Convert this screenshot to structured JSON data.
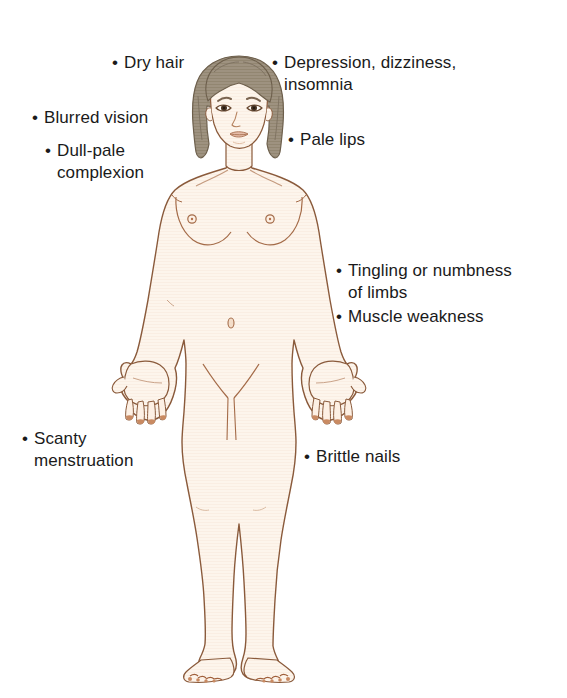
{
  "diagram": {
    "background_color": "#ffffff",
    "text_color": "#1a1a1a",
    "bullet_glyph": "•",
    "colors": {
      "skin_fill": "#fdf5ec",
      "skin_outline": "#8a5a3b",
      "hair_fill": "#9a8d77",
      "hair_outline": "#6d5f4c",
      "face_shadow": "#e8d4c2",
      "nail_color": "#b5714a",
      "eye_color": "#4a3524",
      "lip_color": "#d6a48c"
    }
  },
  "callouts": [
    {
      "id": "dry-hair",
      "bullet": "•",
      "text": "Dry hair"
    },
    {
      "id": "depression",
      "bullet": "•",
      "text": "Depression, dizziness,\ninsomnia"
    },
    {
      "id": "blurred",
      "bullet": "•",
      "text": "Blurred vision"
    },
    {
      "id": "pale-lips",
      "bullet": "•",
      "text": "Pale lips"
    },
    {
      "id": "dull-pale",
      "bullet": "•",
      "text": "Dull-pale\n complexion"
    },
    {
      "id": "tingling",
      "bullet": "•",
      "text": "Tingling or numbness\nof limbs"
    },
    {
      "id": "muscle",
      "bullet": "•",
      "text": "Muscle weakness"
    },
    {
      "id": "scanty",
      "bullet": "•",
      "text": "Scanty\n menstruation"
    },
    {
      "id": "brittle",
      "bullet": "•",
      "text": "Brittle nails"
    }
  ]
}
